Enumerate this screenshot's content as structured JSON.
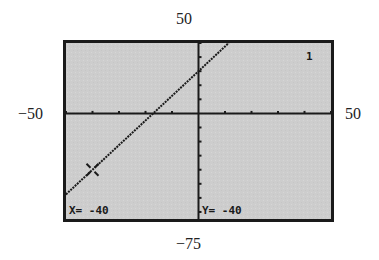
{
  "window_labels": {
    "ymax": "50",
    "ymin": "−75",
    "xmin": "−50",
    "xmax": "50"
  },
  "screen": {
    "plot_indicator": "1",
    "trace_x": "X= -40",
    "trace_y": "Y= -40",
    "background_color": "#cfcfcf",
    "frame_color": "#1a1a1a",
    "plot_color": "#1a1a1a"
  },
  "chart_data": {
    "type": "line",
    "title": "",
    "xlabel": "",
    "ylabel": "",
    "xlim": [
      -50,
      50
    ],
    "ylim": [
      -75,
      50
    ],
    "xscl": 10,
    "yscl": 10,
    "grid": false,
    "series": [
      {
        "name": "Y1",
        "equation_estimate": "y = 1.75x + 30",
        "x": [
          -50,
          -40,
          -30,
          -17.1,
          0,
          11.4
        ],
        "values": [
          -57.5,
          -40,
          -22.5,
          0,
          30,
          50
        ]
      }
    ],
    "trace_cursor": {
      "x": -40,
      "y": -40
    },
    "annotations": [
      "X= -40",
      "Y= -40",
      "1"
    ]
  }
}
